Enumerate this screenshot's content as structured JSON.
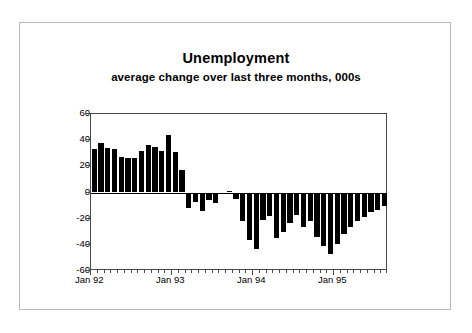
{
  "chart_data": {
    "type": "bar",
    "title": "Unemployment",
    "subtitle": "average change over last three months, 000s",
    "xlabel": "",
    "ylabel": "",
    "ylim": [
      -60,
      60
    ],
    "yticks": [
      60,
      40,
      20,
      0,
      -20,
      -40,
      -60
    ],
    "ytick_labels": [
      "60",
      "40",
      "20",
      "0",
      "-20",
      "-40",
      "-60"
    ],
    "grid": false,
    "legend": "none",
    "x_axis_labels": [
      "Jan 92",
      "Jan 93",
      "Jan 94",
      "Jan 95"
    ],
    "x_label_positions": [
      0,
      12,
      24,
      36
    ],
    "x_start": "Jan 92",
    "x_tick_interval": "monthly",
    "bar_color": "#000000",
    "categories": [
      "Jan 92",
      "Feb 92",
      "Mar 92",
      "Apr 92",
      "May 92",
      "Jun 92",
      "Jul 92",
      "Aug 92",
      "Sep 92",
      "Oct 92",
      "Nov 92",
      "Dec 92",
      "Jan 93",
      "Feb 93",
      "Mar 93",
      "Apr 93",
      "May 93",
      "Jun 93",
      "Jul 93",
      "Aug 93",
      "Sep 93",
      "Oct 93",
      "Nov 93",
      "Dec 93",
      "Jan 94",
      "Feb 94",
      "Mar 94",
      "Apr 94",
      "May 94",
      "Jun 94",
      "Jul 94",
      "Aug 94",
      "Sep 94",
      "Oct 94",
      "Nov 94",
      "Dec 94",
      "Jan 95",
      "Feb 95",
      "Mar 95",
      "Apr 95",
      "May 95",
      "Jun 95",
      "Jul 95",
      "Aug 95"
    ],
    "values": [
      33,
      38,
      34,
      33,
      27,
      26,
      26,
      32,
      36,
      35,
      32,
      44,
      31,
      17,
      -12,
      -7,
      -14,
      -6,
      -8,
      0,
      1,
      -5,
      -22,
      -36,
      -43,
      -21,
      -18,
      -35,
      -30,
      -23,
      -17,
      -26,
      -22,
      -34,
      -41,
      -47,
      -39,
      -32,
      -26,
      -22,
      -19,
      -15,
      -13,
      -10
    ]
  },
  "canvas": {
    "background": "#ffffff",
    "frame_color": "#b9b9b9",
    "axis_color": "#4a4a4a"
  }
}
